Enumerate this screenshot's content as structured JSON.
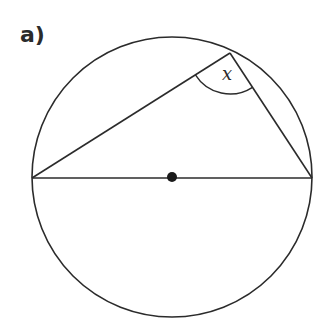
{
  "part_label": "a)",
  "angle_label": "x",
  "colors": {
    "stroke": "#2b2b2b",
    "background": "#ffffff"
  },
  "geometry": {
    "circle": {
      "cx": 172,
      "cy": 177,
      "r": 140
    },
    "center_dot": {
      "x": 172,
      "y": 177
    },
    "points": {
      "left": {
        "x": 32,
        "y": 178
      },
      "right": {
        "x": 312,
        "y": 178
      },
      "top": {
        "x": 230,
        "y": 53
      }
    }
  }
}
